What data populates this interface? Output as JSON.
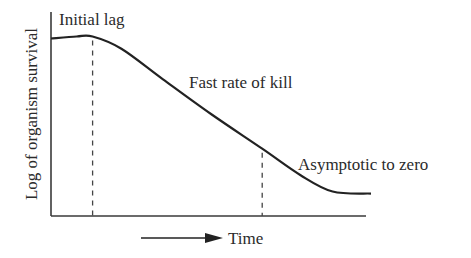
{
  "chart_data": {
    "type": "line",
    "title": "",
    "xlabel": "Time",
    "ylabel": "Log of organism survival",
    "grid": false,
    "legend": "none",
    "phase_boundaries": [
      0.13,
      0.66
    ],
    "series": [
      {
        "name": "survival curve",
        "x": [
          0.0,
          0.08,
          0.13,
          0.22,
          0.35,
          0.5,
          0.66,
          0.78,
          0.88,
          1.0
        ],
        "y": [
          0.87,
          0.88,
          0.88,
          0.82,
          0.67,
          0.5,
          0.33,
          0.2,
          0.12,
          0.11
        ]
      }
    ],
    "annotations": [
      {
        "id": "initial-lag",
        "text": "Initial lag"
      },
      {
        "id": "fast-rate",
        "text": "Fast rate of kill"
      },
      {
        "id": "asymptotic",
        "text": "Asymptotic to zero"
      }
    ],
    "xlim": [
      0,
      1
    ],
    "ylim": [
      0,
      1
    ]
  }
}
